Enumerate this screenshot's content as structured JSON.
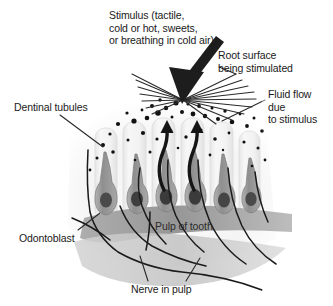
{
  "figure": {
    "background_color": "#ffffff",
    "ink_color": "#1a1a1a"
  },
  "labels": {
    "stimulus": "Stimulus (tactile,\ncold or hot, sweets,\nor breathing in cold air)",
    "root_surface": "Root surface\nbeing stimulated",
    "fluid_flow": "Fluid flow\ndue\nto stimulus",
    "dentinal_tubules": "Dentinal tubules",
    "odontoblast": "Odontoblast",
    "pulp_of_tooth": "Pulp of tooth",
    "nerve_in_pulp": "Nerve in pulp"
  },
  "icons": {
    "stimulus_arrow": "down-left-solid-arrow-icon",
    "fluid_flow_arrow": "curved-up-arrow-icon",
    "radiating_lines": "radiating-lines-icon"
  },
  "colors": {
    "tubule_fill": "#f2f2f2",
    "tubule_stroke": "#d4d4d4",
    "odontoblast_body": "#9a9a9a",
    "odontoblast_nucleus": "#4a4a4a",
    "pulp_band_dark": "#9e9e9e",
    "pulp_band_light": "#c4c4c4",
    "dentin_base": "#ededed",
    "arrow_black": "#151515",
    "nerve_black": "#1a1a1a",
    "particle_black": "#111111"
  },
  "counts": {
    "tubules": 6,
    "odontoblasts": 6,
    "fluid_flow_arrows": 2,
    "radiating_lines": 16
  }
}
